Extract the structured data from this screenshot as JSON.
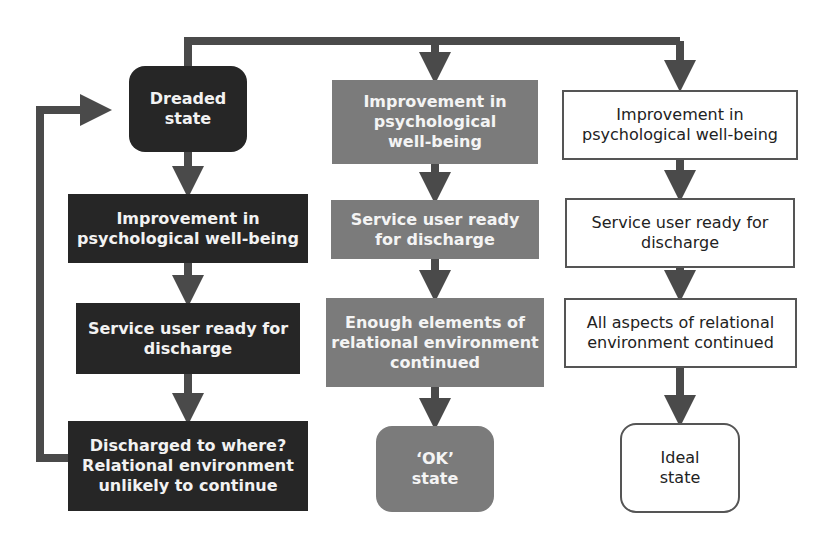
{
  "diagram": {
    "left_column": {
      "tone": "dark",
      "nodes": [
        {
          "id": "dreaded",
          "text": "Dreaded\nstate"
        },
        {
          "id": "l-improve",
          "text": "Improvement in\npsychological well-being"
        },
        {
          "id": "l-ready",
          "text": "Service user ready for\ndischarge"
        },
        {
          "id": "l-discharged",
          "text": "Discharged to where?\nRelational environment\nunlikely to continue"
        }
      ]
    },
    "middle_column": {
      "tone": "mid",
      "nodes": [
        {
          "id": "m-improve",
          "text": "Improvement in\npsychological\nwell-being"
        },
        {
          "id": "m-ready",
          "text": "Service user ready\nfor discharge"
        },
        {
          "id": "m-enough",
          "text": "Enough elements of\nrelational environment\ncontinued"
        },
        {
          "id": "ok",
          "text": "‘OK’\nstate"
        }
      ]
    },
    "right_column": {
      "tone": "light",
      "nodes": [
        {
          "id": "r-improve",
          "text": "Improvement in\npsychological well-being"
        },
        {
          "id": "r-ready",
          "text": "Service user ready for\ndischarge"
        },
        {
          "id": "r-all",
          "text": "All aspects of relational\nenvironment continued"
        },
        {
          "id": "ideal",
          "text": "Ideal\nstate"
        }
      ]
    },
    "colors": {
      "dark": "#262626",
      "mid": "#7b7b7b",
      "arrow": "#4a4a4a",
      "border": "#555555"
    }
  }
}
